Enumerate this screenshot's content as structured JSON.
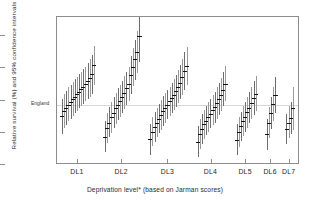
{
  "chart": {
    "type": "scatter",
    "title": "",
    "ylabel": "Relative survival (%) and 95% confidence intervals",
    "xlabel": "Deprivation level* (based on Jarman scores)",
    "y_ticks": [
      "500",
      "400",
      "300",
      "200",
      "100"
    ],
    "y_tick_values": [
      500,
      400,
      300,
      200,
      100
    ],
    "ylim": [
      100,
      560
    ],
    "x_ticks": [
      "DL1",
      "DL2",
      "DL3",
      "DL4",
      "DL5",
      "DL6",
      "DL7"
    ],
    "reference_label": "England",
    "reference_value": 285,
    "grid": false,
    "legend": "none"
  },
  "chart_data": {
    "type": "scatter",
    "title": "",
    "xlabel": "Deprivation level* (based on Jarman scores)",
    "ylabel": "Relative survival (%) and 95% confidence intervals",
    "ylim": [
      100,
      560
    ],
    "y_ticks": [
      100,
      200,
      300,
      400,
      500
    ],
    "categories": [
      "DL1",
      "DL2",
      "DL3",
      "DL4",
      "DL5",
      "DL6",
      "DL7"
    ],
    "grid": false,
    "legend_position": "none",
    "annotations": [
      {
        "text": "England",
        "value": 285,
        "type": "reference-line"
      }
    ],
    "groups": [
      {
        "name": "DL1",
        "n": 16,
        "points": [
          {
            "est": 252,
            "lo": 196,
            "hi": 305
          },
          {
            "est": 268,
            "lo": 215,
            "hi": 320
          },
          {
            "est": 276,
            "lo": 224,
            "hi": 330
          },
          {
            "est": 288,
            "lo": 236,
            "hi": 342
          },
          {
            "est": 296,
            "lo": 244,
            "hi": 350
          },
          {
            "est": 305,
            "lo": 252,
            "hi": 358
          },
          {
            "est": 312,
            "lo": 262,
            "hi": 366
          },
          {
            "est": 320,
            "lo": 268,
            "hi": 374
          },
          {
            "est": 328,
            "lo": 276,
            "hi": 382
          },
          {
            "est": 336,
            "lo": 284,
            "hi": 390
          },
          {
            "est": 344,
            "lo": 290,
            "hi": 398
          },
          {
            "est": 352,
            "lo": 298,
            "hi": 406
          },
          {
            "est": 360,
            "lo": 305,
            "hi": 416
          },
          {
            "est": 370,
            "lo": 312,
            "hi": 428
          },
          {
            "est": 382,
            "lo": 322,
            "hi": 442
          },
          {
            "est": 410,
            "lo": 348,
            "hi": 470
          }
        ]
      },
      {
        "name": "DL2",
        "n": 17,
        "points": [
          {
            "est": 188,
            "lo": 140,
            "hi": 238
          },
          {
            "est": 215,
            "lo": 168,
            "hi": 262
          },
          {
            "est": 232,
            "lo": 186,
            "hi": 280
          },
          {
            "est": 248,
            "lo": 200,
            "hi": 296
          },
          {
            "est": 262,
            "lo": 214,
            "hi": 310
          },
          {
            "est": 276,
            "lo": 228,
            "hi": 324
          },
          {
            "est": 288,
            "lo": 240,
            "hi": 338
          },
          {
            "est": 300,
            "lo": 250,
            "hi": 350
          },
          {
            "est": 312,
            "lo": 262,
            "hi": 362
          },
          {
            "est": 324,
            "lo": 274,
            "hi": 376
          },
          {
            "est": 338,
            "lo": 286,
            "hi": 390
          },
          {
            "est": 352,
            "lo": 298,
            "hi": 406
          },
          {
            "est": 380,
            "lo": 322,
            "hi": 438
          },
          {
            "est": 404,
            "lo": 344,
            "hi": 464
          },
          {
            "est": 428,
            "lo": 364,
            "hi": 490
          },
          {
            "est": 452,
            "lo": 386,
            "hi": 518
          },
          {
            "est": 500,
            "lo": 420,
            "hi": 562
          }
        ]
      },
      {
        "name": "DL3",
        "n": 18,
        "points": [
          {
            "est": 180,
            "lo": 132,
            "hi": 228
          },
          {
            "est": 204,
            "lo": 158,
            "hi": 250
          },
          {
            "est": 218,
            "lo": 172,
            "hi": 264
          },
          {
            "est": 232,
            "lo": 186,
            "hi": 278
          },
          {
            "est": 244,
            "lo": 198,
            "hi": 290
          },
          {
            "est": 256,
            "lo": 210,
            "hi": 302
          },
          {
            "est": 268,
            "lo": 222,
            "hi": 314
          },
          {
            "est": 278,
            "lo": 232,
            "hi": 324
          },
          {
            "est": 288,
            "lo": 242,
            "hi": 334
          },
          {
            "est": 298,
            "lo": 252,
            "hi": 344
          },
          {
            "est": 308,
            "lo": 262,
            "hi": 356
          },
          {
            "est": 318,
            "lo": 270,
            "hi": 366
          },
          {
            "est": 330,
            "lo": 280,
            "hi": 380
          },
          {
            "est": 342,
            "lo": 292,
            "hi": 394
          },
          {
            "est": 356,
            "lo": 304,
            "hi": 410
          },
          {
            "est": 372,
            "lo": 318,
            "hi": 428
          },
          {
            "est": 392,
            "lo": 334,
            "hi": 450
          },
          {
            "est": 408,
            "lo": 348,
            "hi": 468
          }
        ]
      },
      {
        "name": "DL4",
        "n": 14,
        "points": [
          {
            "est": 172,
            "lo": 126,
            "hi": 220
          },
          {
            "est": 196,
            "lo": 150,
            "hi": 242
          },
          {
            "est": 212,
            "lo": 166,
            "hi": 258
          },
          {
            "est": 226,
            "lo": 180,
            "hi": 272
          },
          {
            "est": 238,
            "lo": 192,
            "hi": 284
          },
          {
            "est": 250,
            "lo": 204,
            "hi": 296
          },
          {
            "est": 260,
            "lo": 214,
            "hi": 306
          },
          {
            "est": 270,
            "lo": 224,
            "hi": 318
          },
          {
            "est": 280,
            "lo": 232,
            "hi": 328
          },
          {
            "est": 292,
            "lo": 244,
            "hi": 342
          },
          {
            "est": 304,
            "lo": 254,
            "hi": 354
          },
          {
            "est": 318,
            "lo": 268,
            "hi": 370
          },
          {
            "est": 334,
            "lo": 282,
            "hi": 388
          },
          {
            "est": 352,
            "lo": 298,
            "hi": 408
          }
        ]
      },
      {
        "name": "DL5",
        "n": 10,
        "points": [
          {
            "est": 178,
            "lo": 132,
            "hi": 226
          },
          {
            "est": 202,
            "lo": 156,
            "hi": 248
          },
          {
            "est": 220,
            "lo": 174,
            "hi": 266
          },
          {
            "est": 236,
            "lo": 190,
            "hi": 282
          },
          {
            "est": 250,
            "lo": 204,
            "hi": 296
          },
          {
            "est": 264,
            "lo": 216,
            "hi": 312
          },
          {
            "est": 278,
            "lo": 230,
            "hi": 326
          },
          {
            "est": 292,
            "lo": 242,
            "hi": 342
          },
          {
            "est": 308,
            "lo": 256,
            "hi": 360
          },
          {
            "est": 322,
            "lo": 268,
            "hi": 376
          }
        ]
      },
      {
        "name": "DL6",
        "n": 5,
        "points": [
          {
            "est": 196,
            "lo": 148,
            "hi": 244
          },
          {
            "est": 232,
            "lo": 184,
            "hi": 280
          },
          {
            "est": 262,
            "lo": 212,
            "hi": 312
          },
          {
            "est": 290,
            "lo": 238,
            "hi": 342
          },
          {
            "est": 318,
            "lo": 262,
            "hi": 374
          }
        ]
      },
      {
        "name": "DL7",
        "n": 4,
        "points": [
          {
            "est": 212,
            "lo": 164,
            "hi": 260
          },
          {
            "est": 232,
            "lo": 184,
            "hi": 282
          },
          {
            "est": 246,
            "lo": 196,
            "hi": 296
          },
          {
            "est": 276,
            "lo": 210,
            "hi": 342
          }
        ]
      }
    ]
  }
}
